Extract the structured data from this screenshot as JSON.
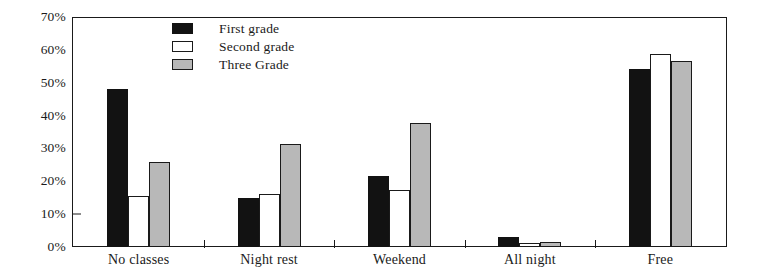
{
  "chart_data": {
    "type": "bar",
    "title": "",
    "subtitle": "",
    "xlabel": "",
    "ylabel": "",
    "ylim": [
      0,
      70
    ],
    "ytick_labels": [
      "0%",
      "10%",
      "20%",
      "30%",
      "40%",
      "50%",
      "60%",
      "70%"
    ],
    "ytick_values": [
      0,
      10,
      20,
      30,
      40,
      50,
      60,
      70
    ],
    "grid": false,
    "legend_position": "top-center",
    "categories": [
      "No classes",
      "Night rest",
      "Weekend",
      "All night",
      "Free"
    ],
    "series": [
      {
        "name": "First grade",
        "color": "#121212",
        "values": [
          48.5,
          15.0,
          21.5,
          3.0,
          54.5
        ]
      },
      {
        "name": "Second grade",
        "color": "#ffffff",
        "values": [
          15.5,
          16.0,
          17.5,
          1.0,
          59.0
        ]
      },
      {
        "name": "Three Grade",
        "color": "#b8b8b8",
        "values": [
          26.0,
          31.5,
          38.0,
          1.5,
          57.0
        ]
      }
    ]
  },
  "axes": {
    "y_ticks": [
      {
        "label": "70%",
        "value": 70,
        "mark": false
      },
      {
        "label": "60%",
        "value": 60,
        "mark": false
      },
      {
        "label": "50%",
        "value": 50,
        "mark": false
      },
      {
        "label": "40%",
        "value": 40,
        "mark": false
      },
      {
        "label": "30%",
        "value": 30,
        "mark": false
      },
      {
        "label": "20%",
        "value": 20,
        "mark": false
      },
      {
        "label": "10%",
        "value": 10,
        "mark": true
      },
      {
        "label": "0%",
        "value": 0,
        "mark": false
      }
    ],
    "x_categories": [
      {
        "label": "No classes"
      },
      {
        "label": "Night rest"
      },
      {
        "label": "Weekend"
      },
      {
        "label": "All night"
      },
      {
        "label": "Free"
      }
    ]
  },
  "legend": {
    "items": [
      {
        "label": "First grade",
        "swatch": "series-first"
      },
      {
        "label": "Second grade",
        "swatch": "series-second"
      },
      {
        "label": "Three Grade",
        "swatch": "series-three"
      }
    ]
  }
}
